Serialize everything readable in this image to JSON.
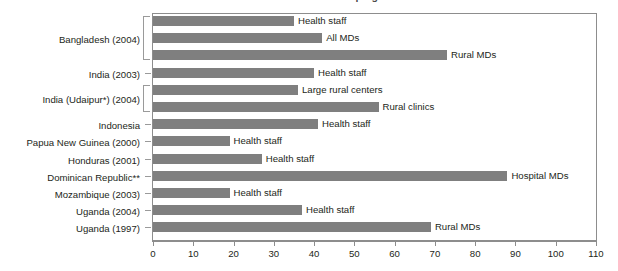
{
  "figure": {
    "title": "FIGURE 10-1   Nurse and Medical Doctor Absenteeism Rates in Developing Countries",
    "bar_color": "#7f7f7f",
    "frame_color": "#8d8d8d"
  },
  "chart_data": {
    "type": "bar",
    "orientation": "horizontal",
    "title": "FIGURE 10-1   Nurse and Medical Doctor Absenteeism Rates in Developing Countries",
    "xlabel": "",
    "ylabel": "",
    "xlim": [
      0,
      110
    ],
    "xticks": [
      0,
      10,
      20,
      30,
      40,
      50,
      60,
      70,
      80,
      90,
      100,
      110
    ],
    "grid": false,
    "legend": false,
    "categories": [
      "Bangladesh (2004)",
      "India (2003)",
      "India (Udaipur*) (2004)",
      "Indonesia",
      "Papua New Guinea (2000)",
      "Honduras (2001)",
      "Dominican Republic**",
      "Mozambique (2003)",
      "Uganda (2004)",
      "Uganda (1997)"
    ],
    "bars": [
      {
        "category": "Bangladesh (2004)",
        "label": "Health staff",
        "value": 35
      },
      {
        "category": "Bangladesh (2004)",
        "label": "All MDs",
        "value": 42
      },
      {
        "category": "Bangladesh (2004)",
        "label": "Rural MDs",
        "value": 73
      },
      {
        "category": "India (2003)",
        "label": "Health staff",
        "value": 40
      },
      {
        "category": "India (Udaipur*) (2004)",
        "label": "Large rural centers",
        "value": 36
      },
      {
        "category": "India (Udaipur*) (2004)",
        "label": "Rural clinics",
        "value": 56
      },
      {
        "category": "Indonesia",
        "label": "Health staff",
        "value": 41
      },
      {
        "category": "Papua New Guinea (2000)",
        "label": "Health staff",
        "value": 19
      },
      {
        "category": "Honduras (2001)",
        "label": "Health staff",
        "value": 27
      },
      {
        "category": "Dominican Republic**",
        "label": "Hospital MDs",
        "value": 88
      },
      {
        "category": "Mozambique (2003)",
        "label": "Health staff",
        "value": 19
      },
      {
        "category": "Uganda (2004)",
        "label": "Health staff",
        "value": 37
      },
      {
        "category": "Uganda (1997)",
        "label": "Rural MDs",
        "value": 69
      }
    ],
    "category_label_rows": [
      {
        "label": "Bangladesh (2004)",
        "row_start": 0,
        "row_end": 2
      },
      {
        "label": "India (2003)",
        "row_start": 3,
        "row_end": 3
      },
      {
        "label": "India (Udaipur*) (2004)",
        "row_start": 4,
        "row_end": 5
      },
      {
        "label": "Indonesia",
        "row_start": 6,
        "row_end": 6
      },
      {
        "label": "Papua New Guinea (2000)",
        "row_start": 7,
        "row_end": 7
      },
      {
        "label": "Honduras (2001)",
        "row_start": 8,
        "row_end": 8
      },
      {
        "label": "Dominican Republic**",
        "row_start": 9,
        "row_end": 9
      },
      {
        "label": "Mozambique (2003)",
        "row_start": 10,
        "row_end": 10
      },
      {
        "label": "Uganda (2004)",
        "row_start": 11,
        "row_end": 11
      },
      {
        "label": "Uganda (1997)",
        "row_start": 12,
        "row_end": 12
      }
    ]
  }
}
